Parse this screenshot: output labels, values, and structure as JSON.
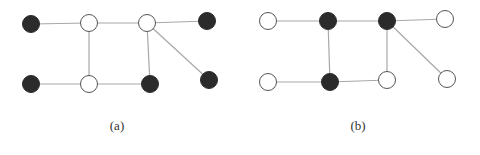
{
  "colors": {
    "filled_node": "#2b2b2b",
    "open_node_fill": "#ffffff",
    "node_stroke": "#555555",
    "edge": "#a8a8a8",
    "label": "#333333"
  },
  "node_radius": 8.5,
  "panels": [
    {
      "id": "a",
      "label": "(a)",
      "label_pos": [
        117,
        130
      ],
      "nodes": [
        {
          "id": "a1",
          "x": 31,
          "y": 24,
          "filled": true
        },
        {
          "id": "a2",
          "x": 89,
          "y": 23,
          "filled": false
        },
        {
          "id": "a3",
          "x": 147,
          "y": 23,
          "filled": false
        },
        {
          "id": "a4",
          "x": 207,
          "y": 21,
          "filled": true
        },
        {
          "id": "a5",
          "x": 31,
          "y": 84,
          "filled": true
        },
        {
          "id": "a6",
          "x": 89,
          "y": 84,
          "filled": false
        },
        {
          "id": "a7",
          "x": 150,
          "y": 84,
          "filled": true
        },
        {
          "id": "a8",
          "x": 209,
          "y": 80,
          "filled": true
        }
      ],
      "edges": [
        [
          "a1",
          "a2"
        ],
        [
          "a2",
          "a3"
        ],
        [
          "a3",
          "a4"
        ],
        [
          "a2",
          "a6"
        ],
        [
          "a3",
          "a7"
        ],
        [
          "a3",
          "a8"
        ],
        [
          "a5",
          "a6"
        ],
        [
          "a6",
          "a7"
        ]
      ]
    },
    {
      "id": "b",
      "label": "(b)",
      "label_pos": [
        358,
        130
      ],
      "nodes": [
        {
          "id": "b1",
          "x": 268,
          "y": 21,
          "filled": false
        },
        {
          "id": "b2",
          "x": 328,
          "y": 21,
          "filled": true
        },
        {
          "id": "b3",
          "x": 387,
          "y": 21,
          "filled": true
        },
        {
          "id": "b4",
          "x": 445,
          "y": 19,
          "filled": false
        },
        {
          "id": "b5",
          "x": 268,
          "y": 82,
          "filled": false
        },
        {
          "id": "b6",
          "x": 330,
          "y": 82,
          "filled": true
        },
        {
          "id": "b7",
          "x": 387,
          "y": 80,
          "filled": false
        },
        {
          "id": "b8",
          "x": 447,
          "y": 79,
          "filled": false
        }
      ],
      "edges": [
        [
          "b1",
          "b2"
        ],
        [
          "b2",
          "b3"
        ],
        [
          "b3",
          "b4"
        ],
        [
          "b2",
          "b6"
        ],
        [
          "b3",
          "b7"
        ],
        [
          "b3",
          "b8"
        ],
        [
          "b5",
          "b6"
        ],
        [
          "b6",
          "b7"
        ]
      ]
    }
  ]
}
